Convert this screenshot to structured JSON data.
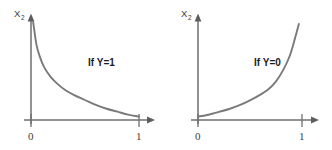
{
  "figure": {
    "background_color": "#ffffff",
    "axis_color": "#6f6f6f",
    "curve_color": "#7a7a7a",
    "text_color": "#1c1c1c",
    "width": 332,
    "height": 150
  },
  "chart_data": [
    {
      "type": "line",
      "title": "",
      "annotation": "If Y=1",
      "xlabel": "",
      "ylabel": "X",
      "ylabel_subscript": "2",
      "xticks": [
        "0",
        "1"
      ],
      "xtick_values": [
        0,
        1
      ],
      "yticks": [],
      "xlim": [
        0,
        1
      ],
      "ylim": [
        0,
        1
      ],
      "grid": false,
      "legend": "none",
      "series": [
        {
          "name": "cost when y=1",
          "formula": "-log(x)",
          "x": [
            0.02,
            0.05,
            0.08,
            0.12,
            0.18,
            0.25,
            0.32,
            0.4,
            0.5,
            0.6,
            0.7,
            0.8,
            0.9,
            1.0
          ],
          "values": [
            1.0,
            0.77,
            0.65,
            0.54,
            0.44,
            0.36,
            0.3,
            0.25,
            0.2,
            0.15,
            0.11,
            0.08,
            0.05,
            0.03
          ]
        }
      ]
    },
    {
      "type": "line",
      "title": "",
      "annotation": "If Y=0",
      "xlabel": "",
      "ylabel": "X",
      "ylabel_subscript": "2",
      "xticks": [
        "0",
        "1"
      ],
      "xtick_values": [
        0,
        1
      ],
      "yticks": [],
      "xlim": [
        0,
        1
      ],
      "ylim": [
        0,
        1
      ],
      "grid": false,
      "legend": "none",
      "series": [
        {
          "name": "cost when y=0",
          "formula": "-log(1-x)",
          "x": [
            0.0,
            0.1,
            0.2,
            0.3,
            0.4,
            0.5,
            0.6,
            0.68,
            0.75,
            0.82,
            0.88,
            0.92,
            0.95,
            0.97
          ],
          "values": [
            0.03,
            0.05,
            0.08,
            0.11,
            0.15,
            0.2,
            0.26,
            0.32,
            0.4,
            0.52,
            0.66,
            0.8,
            0.92,
            1.0
          ]
        }
      ]
    }
  ],
  "panels": [
    {
      "id": "left",
      "annotation": "If Y=1",
      "ylabel": "X",
      "ylabel_subscript": "2",
      "tick_zero": "0",
      "tick_one": "1"
    },
    {
      "id": "right",
      "annotation": "If Y=0",
      "ylabel": "X",
      "ylabel_subscript": "2",
      "tick_zero": "0",
      "tick_one": "1"
    }
  ]
}
